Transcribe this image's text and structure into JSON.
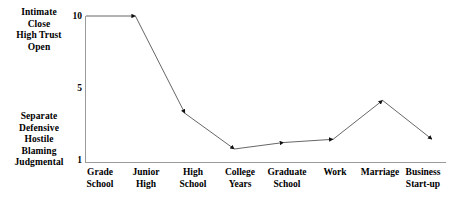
{
  "chart_data": {
    "type": "line",
    "title": "",
    "xlabel": "",
    "ylabel": "",
    "ylim": [
      1,
      10
    ],
    "yticks": [
      1,
      5,
      10
    ],
    "grid": false,
    "legend": false,
    "categories": [
      "Grade School",
      "Junior High",
      "High School",
      "College Years",
      "Graduate School",
      "Work",
      "Marriage",
      "Business Start-up"
    ],
    "values": [
      10,
      10,
      4,
      1.8,
      2.2,
      2.4,
      4.8,
      2.4
    ],
    "series": [
      {
        "name": "Level of openness and trust",
        "values": [
          10,
          10,
          4,
          1.8,
          2.2,
          2.4,
          4.8,
          2.4
        ]
      }
    ],
    "point_labels": [
      {
        "category": "Grade School",
        "value": 10
      },
      {
        "category": "Junior High",
        "value": 10
      },
      {
        "category": "High School",
        "value": 4
      },
      {
        "category": "College Years",
        "value": 1.8
      },
      {
        "category": "Graduate School",
        "value": 2.2
      },
      {
        "category": "Work",
        "value": 2.4
      },
      {
        "category": "Marriage",
        "value": 4.8
      },
      {
        "category": "Business Start-up",
        "value": 2.4
      }
    ],
    "marker": "arrowhead",
    "line_color": "#555555",
    "marker_color": "#111111",
    "axis_color": "#999999"
  },
  "axis": {
    "ytick_top": "10",
    "ytick_mid": "5",
    "ytick_bottom": "1"
  },
  "annotations": {
    "top_scale": {
      "lines": [
        "Intimate",
        "Close",
        "High Trust",
        "Open"
      ]
    },
    "bottom_scale": {
      "lines": [
        "Separate",
        "Defensive",
        "Hostile",
        "Blaming",
        "Judgmental"
      ]
    }
  },
  "xlabels": [
    {
      "line1": "Grade",
      "line2": "School"
    },
    {
      "line1": "Junior",
      "line2": "High"
    },
    {
      "line1": "High",
      "line2": "School"
    },
    {
      "line1": "College",
      "line2": "Years"
    },
    {
      "line1": "Graduate",
      "line2": "School"
    },
    {
      "line1": "Work",
      "line2": ""
    },
    {
      "line1": "Marriage",
      "line2": ""
    },
    {
      "line1": "Business",
      "line2": "Start-up"
    }
  ]
}
